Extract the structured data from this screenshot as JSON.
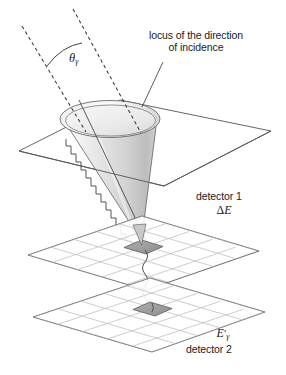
{
  "figure": {
    "background_color": "#ffffff",
    "line_color": "#4a4a4a",
    "text_color": "#1a1a1a"
  },
  "labels": {
    "locus_line1": "locus of the direction",
    "locus_line2": "of incidence",
    "theta_symbol": "θ",
    "theta_subscript": "γ",
    "detector1_name": "detector 1",
    "detector1_energy_delta": "Δ",
    "detector1_energy_symbol": "E",
    "detector2_energy_symbol": "E",
    "detector2_energy_prime": "′",
    "detector2_energy_subscript": "γ",
    "detector2_name": "detector 2"
  },
  "elements": {
    "locus_plane": "locus-plane",
    "cone": "incidence-cone",
    "cone_rim": "cone-rim-ellipse",
    "incidence_line_left": "dashed-incidence-line-left",
    "incidence_line_right": "dashed-incidence-line-right",
    "angle_arc": "theta-angle-arc",
    "scatter_ray": "scattered-photon-ray",
    "wavy_photon_upper": "wavy-photon-path-upper",
    "wavy_photon_lower": "wavy-photon-path-lower",
    "detector1_plane": "detector1-grid-plane",
    "detector1_hit": "detector1-hit-cell",
    "detector2_plane": "detector2-grid-plane",
    "detector2_hit": "detector2-hit-cell",
    "leader_line": "locus-label-leader-line"
  },
  "colors": {
    "stroke": "#4a4a4a",
    "grid": "#b9b9b9",
    "plane_edge": "#555555",
    "cone_light": "#fdfdfd",
    "cone_mid": "#e4e4e4",
    "cone_dark": "#bcbcbc",
    "hit_cell": "#9d9d9d",
    "hit_cell_edge": "#5a5a5a"
  }
}
